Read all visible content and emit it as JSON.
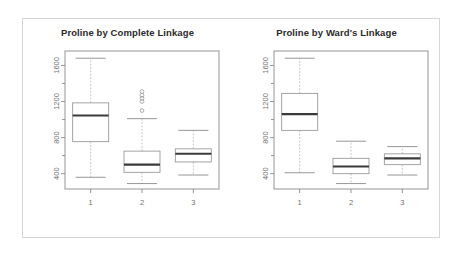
{
  "figure": {
    "background_color": "#ffffff",
    "frame_color": "#d6d6d6",
    "panel_count": 2
  },
  "chart_data": [
    {
      "type": "box",
      "panel_id": "complete-linkage",
      "title": "Proline by Complete Linkage",
      "xlabel": "",
      "ylabel": "",
      "categories": [
        "1",
        "2",
        "3"
      ],
      "xtick_labels": [
        "1",
        "2",
        "3"
      ],
      "ytick_labels": [
        "400",
        "800",
        "1200",
        "1600"
      ],
      "ytick_values": [
        400,
        800,
        1200,
        1600
      ],
      "ylim": [
        230,
        1760
      ],
      "grid": false,
      "legend": "none",
      "boxes": [
        {
          "category": "1",
          "whisker_low": 360,
          "q1": 755,
          "median": 1045,
          "q3": 1185,
          "whisker_high": 1680,
          "outliers": []
        },
        {
          "category": "2",
          "whisker_low": 290,
          "q1": 415,
          "median": 500,
          "q3": 650,
          "whisker_high": 1010,
          "outliers": [
            1100,
            1200,
            1235,
            1270,
            1310
          ]
        },
        {
          "category": "3",
          "whisker_low": 385,
          "q1": 530,
          "median": 620,
          "q3": 675,
          "whisker_high": 880,
          "outliers": []
        }
      ]
    },
    {
      "type": "box",
      "panel_id": "wards-linkage",
      "title": "Proline by Ward's Linkage",
      "xlabel": "",
      "ylabel": "",
      "categories": [
        "1",
        "2",
        "3"
      ],
      "xtick_labels": [
        "1",
        "2",
        "3"
      ],
      "ytick_labels": [
        "400",
        "800",
        "1200",
        "1600"
      ],
      "ytick_values": [
        400,
        800,
        1200,
        1600
      ],
      "ylim": [
        230,
        1760
      ],
      "grid": false,
      "legend": "none",
      "boxes": [
        {
          "category": "1",
          "whisker_low": 410,
          "q1": 880,
          "median": 1060,
          "q3": 1290,
          "whisker_high": 1680,
          "outliers": []
        },
        {
          "category": "2",
          "whisker_low": 290,
          "q1": 400,
          "median": 480,
          "q3": 570,
          "whisker_high": 760,
          "outliers": []
        },
        {
          "category": "3",
          "whisker_low": 385,
          "q1": 500,
          "median": 570,
          "q3": 620,
          "whisker_high": 700,
          "outliers": []
        }
      ]
    }
  ]
}
